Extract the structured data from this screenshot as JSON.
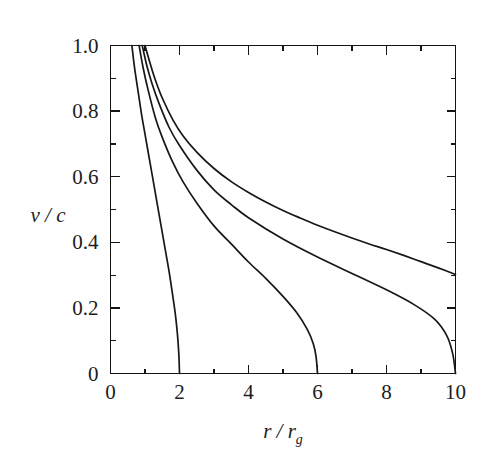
{
  "figure": {
    "background_color": "#ffffff",
    "ink_color": "#15171a"
  },
  "chart_data": {
    "type": "line",
    "title": "",
    "subtitle": "",
    "xlabel": "r / r",
    "xlabel_sub": "g",
    "ylabel": "v / c",
    "xlim": [
      0,
      10
    ],
    "ylim": [
      0,
      1.0
    ],
    "grid": false,
    "legend": "none",
    "axis_box": true,
    "tick_direction": "in",
    "x_ticks_major": [
      0,
      2,
      4,
      6,
      8,
      10
    ],
    "x_ticklabels": [
      "0",
      "2",
      "4",
      "6",
      "8",
      "10"
    ],
    "x_ticks_minor": [
      1,
      3,
      5,
      7,
      9
    ],
    "y_ticks_major": [
      0,
      0.2,
      0.4,
      0.6,
      0.8,
      1.0
    ],
    "y_ticklabels": [
      "0",
      "0.2",
      "0.4",
      "0.6",
      "0.8",
      "1.0"
    ],
    "y_ticks_minor": [
      0.1,
      0.3,
      0.5,
      0.7,
      0.9
    ],
    "series": [
      {
        "name": "curve-1-rmax-2",
        "terminal_x": 2,
        "terminal_y": 0,
        "x": [
          0.62,
          0.7,
          0.8,
          0.9,
          1.0,
          1.1,
          1.2,
          1.3,
          1.4,
          1.5,
          1.6,
          1.7,
          1.8,
          1.88,
          1.94,
          1.98,
          2.0
        ],
        "y": [
          1.0,
          0.93,
          0.86,
          0.79,
          0.73,
          0.67,
          0.61,
          0.55,
          0.49,
          0.43,
          0.37,
          0.31,
          0.24,
          0.18,
          0.12,
          0.06,
          0.0
        ]
      },
      {
        "name": "curve-2-rmax-6",
        "terminal_x": 6,
        "terminal_y": 0,
        "x": [
          0.83,
          0.95,
          1.1,
          1.3,
          1.5,
          1.8,
          2.1,
          2.5,
          3.0,
          3.5,
          4.0,
          4.5,
          5.0,
          5.4,
          5.7,
          5.88,
          5.96,
          6.0
        ],
        "y": [
          1.0,
          0.93,
          0.86,
          0.78,
          0.72,
          0.645,
          0.585,
          0.52,
          0.45,
          0.395,
          0.34,
          0.29,
          0.235,
          0.185,
          0.135,
          0.09,
          0.05,
          0.0
        ]
      },
      {
        "name": "curve-3-rmax-10",
        "terminal_x": 10,
        "terminal_y": 0,
        "x": [
          0.92,
          1.05,
          1.2,
          1.4,
          1.7,
          2.0,
          2.5,
          3.0,
          3.5,
          4.0,
          5.0,
          6.0,
          7.0,
          8.0,
          8.8,
          9.4,
          9.75,
          9.92,
          10.0
        ],
        "y": [
          1.0,
          0.94,
          0.885,
          0.825,
          0.75,
          0.695,
          0.62,
          0.56,
          0.515,
          0.475,
          0.41,
          0.355,
          0.305,
          0.255,
          0.21,
          0.165,
          0.115,
          0.06,
          0.0
        ]
      },
      {
        "name": "curve-4-asymptotic",
        "terminal_x": 10,
        "terminal_y": 0.3,
        "x": [
          1.0,
          1.15,
          1.3,
          1.5,
          1.8,
          2.1,
          2.5,
          3.0,
          3.5,
          4.0,
          4.5,
          5.0,
          5.5,
          6.0,
          6.5,
          7.0,
          7.5,
          8.0,
          8.5,
          9.0,
          9.5,
          10.0
        ],
        "y": [
          1.0,
          0.945,
          0.895,
          0.84,
          0.775,
          0.725,
          0.675,
          0.625,
          0.585,
          0.552,
          0.523,
          0.497,
          0.474,
          0.452,
          0.432,
          0.413,
          0.395,
          0.378,
          0.36,
          0.341,
          0.322,
          0.302
        ]
      }
    ]
  }
}
